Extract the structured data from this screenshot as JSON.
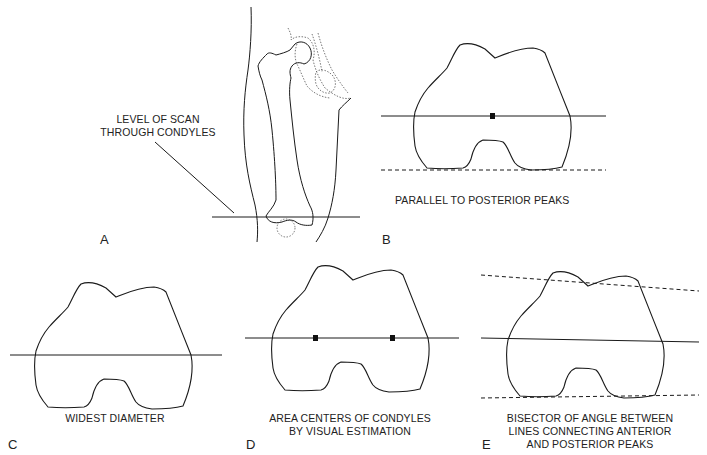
{
  "figure": {
    "panels": [
      {
        "id": "A",
        "letter": "A",
        "caption_lines": [
          "LEVEL OF SCAN",
          "THROUGH CONDYLES"
        ],
        "content": "thigh outline with femur and hip, horizontal scan line through condyles"
      },
      {
        "id": "B",
        "letter": "B",
        "caption_lines": [
          "PARALLEL TO POSTERIOR PEAKS"
        ],
        "content": "condyle cross-section, horizontal axis line with center marker, dashed line along posterior peaks"
      },
      {
        "id": "C",
        "letter": "C",
        "caption_lines": [
          "WIDEST DIAMETER"
        ],
        "content": "condyle cross-section with line across widest diameter"
      },
      {
        "id": "D",
        "letter": "D",
        "caption_lines": [
          "AREA CENTERS OF CONDYLES",
          "BY VISUAL ESTIMATION"
        ],
        "content": "condyle cross-section with line connecting two area-center markers"
      },
      {
        "id": "E",
        "letter": "E",
        "caption_lines": [
          "BISECTOR OF ANGLE BETWEEN",
          "LINES CONNECTING ANTERIOR",
          "AND POSTERIOR PEAKS"
        ],
        "content": "condyle cross-section with dashed anterior and posterior peak lines and bisector"
      }
    ]
  },
  "colors": {
    "line": "#1a1a1a",
    "dotted": "#555555",
    "background": "#ffffff"
  }
}
